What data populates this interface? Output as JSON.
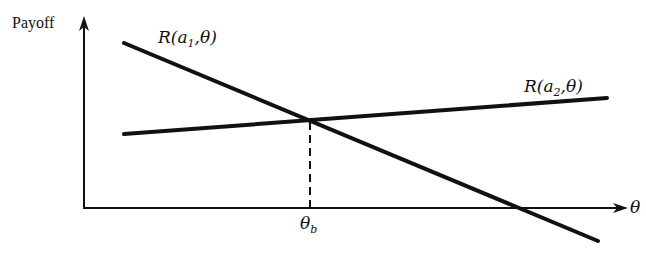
{
  "figure": {
    "y_axis_label": "Payoff",
    "x_axis_label": "θ",
    "line1": {
      "prefix": "R(a",
      "sub": "1",
      "suffix": ",θ)"
    },
    "line2": {
      "prefix": "R(a",
      "sub": "2",
      "suffix": ",θ)"
    },
    "breakpoint": {
      "symbol": "θ",
      "sub": "b"
    }
  },
  "colors": {
    "ink": "#111111",
    "background": "#ffffff"
  }
}
